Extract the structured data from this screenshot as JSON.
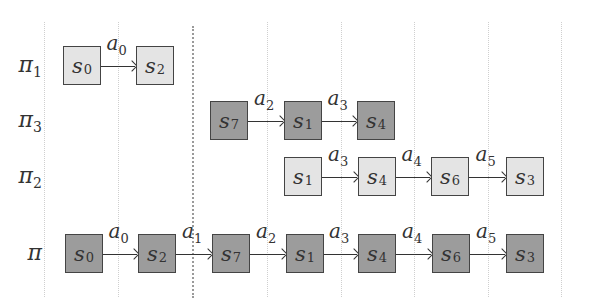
{
  "colors": {
    "light_box": "#e4e4e4",
    "dark_box": "#9c9c9c",
    "border": "#444444",
    "grid": "#cfcfcf",
    "separator": "#9a9a9a"
  },
  "grid_lines_x": [
    44,
    118,
    267,
    341,
    414,
    488,
    561
  ],
  "separator_x": 192,
  "rows": [
    {
      "id": "pi1",
      "label": "π",
      "label_sub": "1",
      "shade": "light",
      "y": 46,
      "states": [
        {
          "name": "s",
          "sub": "0",
          "x": 63
        },
        {
          "name": "s",
          "sub": "2",
          "x": 136
        }
      ],
      "actions": [
        {
          "name": "a",
          "sub": "0"
        }
      ]
    },
    {
      "id": "pi3",
      "label": "π",
      "label_sub": "3",
      "shade": "dark",
      "y": 101,
      "states": [
        {
          "name": "s",
          "sub": "7",
          "x": 210
        },
        {
          "name": "s",
          "sub": "1",
          "x": 284
        },
        {
          "name": "s",
          "sub": "4",
          "x": 357
        }
      ],
      "actions": [
        {
          "name": "a",
          "sub": "2"
        },
        {
          "name": "a",
          "sub": "3"
        }
      ]
    },
    {
      "id": "pi2",
      "label": "π",
      "label_sub": "2",
      "shade": "light",
      "y": 157,
      "states": [
        {
          "name": "s",
          "sub": "1",
          "x": 284
        },
        {
          "name": "s",
          "sub": "4",
          "x": 358
        },
        {
          "name": "s",
          "sub": "6",
          "x": 431
        },
        {
          "name": "s",
          "sub": "3",
          "x": 506
        }
      ],
      "actions": [
        {
          "name": "a",
          "sub": "3"
        },
        {
          "name": "a",
          "sub": "4"
        },
        {
          "name": "a",
          "sub": "5"
        }
      ]
    },
    {
      "id": "pi",
      "label": "π",
      "label_sub": "",
      "shade": "dark",
      "y": 234,
      "states": [
        {
          "name": "s",
          "sub": "0",
          "x": 65
        },
        {
          "name": "s",
          "sub": "2",
          "x": 138
        },
        {
          "name": "s",
          "sub": "7",
          "x": 212
        },
        {
          "name": "s",
          "sub": "1",
          "x": 286
        },
        {
          "name": "s",
          "sub": "4",
          "x": 358
        },
        {
          "name": "s",
          "sub": "6",
          "x": 432
        },
        {
          "name": "s",
          "sub": "3",
          "x": 506
        }
      ],
      "actions": [
        {
          "name": "a",
          "sub": "0"
        },
        {
          "name": "a",
          "sub": "1"
        },
        {
          "name": "a",
          "sub": "2"
        },
        {
          "name": "a",
          "sub": "3"
        },
        {
          "name": "a",
          "sub": "4"
        },
        {
          "name": "a",
          "sub": "5"
        }
      ]
    }
  ]
}
